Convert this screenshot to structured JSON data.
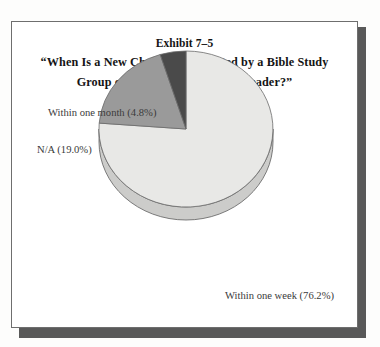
{
  "exhibit": {
    "number": "Exhibit 7–5",
    "title_line_1": "“When Is a New Christian Contacted by a Bible Study",
    "title_line_2": "Group or Sunday School Class Leader?”"
  },
  "labels": {
    "within_month": "Within one month (4.8%)",
    "na": "N/A (19.0%)",
    "within_week": "Within one week (76.2%)"
  },
  "colors": {
    "slice_within_week": "#e8e8e6",
    "slice_na": "#9a9a9a",
    "slice_within_month": "#4a4a4a",
    "slice_within_week_side": "#d8d8d6",
    "slice_na_side": "#7f7f7f",
    "outline": "#6b6b6b",
    "frame": "#6e6e6e",
    "shadow": "#595959",
    "title_text": "#141414",
    "label_text": "#3a3a3a",
    "page_background": "#ffffff"
  },
  "chart_data": {
    "type": "pie",
    "title": "“When Is a New Christian Contacted by a Bible Study Group or Sunday School Class Leader?”",
    "subtitle": "Exhibit 7–5",
    "xlabel": "",
    "ylabel": "",
    "grid": false,
    "legend": "callout-labels",
    "three_d": true,
    "start_angle_deg": 0,
    "direction": "clockwise",
    "categories": [
      "Within one week",
      "N/A",
      "Within one month"
    ],
    "values": [
      76.2,
      19.0,
      4.8
    ],
    "units": "percent",
    "slices": [
      {
        "label": "Within one week (76.2%)",
        "category": "Within one week",
        "value": 76.2,
        "color": "#e8e8e6",
        "callout_position": "bottom-right"
      },
      {
        "label": "N/A (19.0%)",
        "category": "N/A",
        "value": 19.0,
        "color": "#9a9a9a",
        "callout_position": "left"
      },
      {
        "label": "Within one month (4.8%)",
        "category": "Within one month",
        "value": 4.8,
        "color": "#4a4a4a",
        "callout_position": "top-left"
      }
    ]
  }
}
